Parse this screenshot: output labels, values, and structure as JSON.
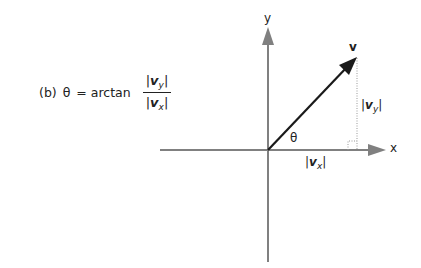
{
  "formula": {
    "prefix": "(b)",
    "theta": "θ",
    "equals": "= arctan",
    "numerator": {
      "bar_l": "|",
      "symbol": "v",
      "sub": "y",
      "bar_r": "|"
    },
    "denominator": {
      "bar_l": "|",
      "symbol": "v",
      "sub": "x",
      "bar_r": "|"
    }
  },
  "diagram": {
    "axis_x_label": "x",
    "axis_y_label": "y",
    "vector_label": "v",
    "angle_label": "θ",
    "vy_label": {
      "bar_l": "|",
      "symbol": "v",
      "sub": "y",
      "bar_r": "|"
    },
    "vx_label": {
      "bar_l": "|",
      "symbol": "v",
      "sub": "x",
      "bar_r": "|"
    },
    "colors": {
      "axis": "#808080",
      "vector": "#1a1a1a",
      "dotted": "#999999"
    }
  }
}
